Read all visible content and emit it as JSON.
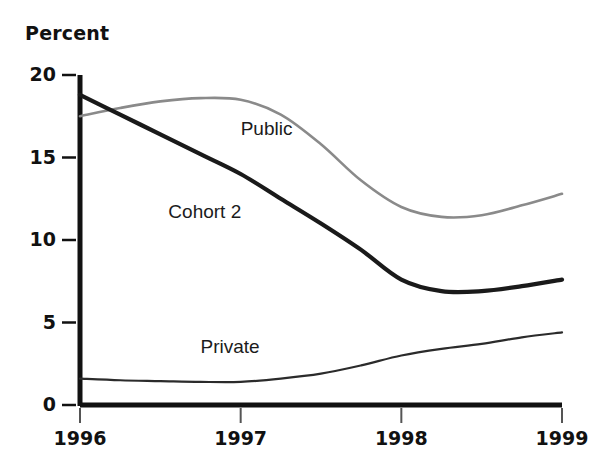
{
  "chart_data": {
    "type": "line",
    "title": "",
    "ylabel": "Percent",
    "xlabel": "",
    "ylim": [
      0,
      20
    ],
    "xlim": [
      1996,
      1999
    ],
    "grid": false,
    "legend_position": "inline-labels",
    "yticks": [
      "0",
      "5",
      "10",
      "15",
      "20"
    ],
    "ytick_values": [
      0,
      5,
      10,
      15,
      20
    ],
    "xticks": [
      "1996",
      "1997",
      "1998",
      "1999"
    ],
    "xtick_values": [
      1996,
      1997,
      1998,
      1999
    ],
    "x": [
      1996.0,
      1996.25,
      1996.5,
      1996.75,
      1997.0,
      1997.25,
      1997.5,
      1997.75,
      1998.0,
      1998.25,
      1998.5,
      1998.75,
      1999.0
    ],
    "series": [
      {
        "name": "Public",
        "color": "#8a8a8a",
        "style": "solid-thin-gray",
        "values": [
          17.5,
          18.0,
          18.4,
          18.6,
          18.5,
          17.6,
          15.8,
          13.6,
          12.0,
          11.4,
          11.5,
          12.1,
          12.8
        ]
      },
      {
        "name": "Cohort 2",
        "color": "#1a1a1a",
        "style": "solid-thick-black",
        "values": [
          18.8,
          17.6,
          16.4,
          15.2,
          14.0,
          12.5,
          11.0,
          9.4,
          7.6,
          6.9,
          6.9,
          7.2,
          7.6
        ]
      },
      {
        "name": "Private",
        "color": "#2b2b2b",
        "style": "solid-thin-black",
        "values": [
          1.6,
          1.5,
          1.45,
          1.4,
          1.4,
          1.6,
          1.9,
          2.4,
          3.0,
          3.4,
          3.7,
          4.1,
          4.4
        ]
      }
    ],
    "annotations": [
      {
        "text": "Public",
        "x": 1997.0,
        "y": 16.6
      },
      {
        "text": "Cohort 2",
        "x": 1996.55,
        "y": 11.6
      },
      {
        "text": "Private",
        "x": 1996.75,
        "y": 3.4
      }
    ]
  }
}
